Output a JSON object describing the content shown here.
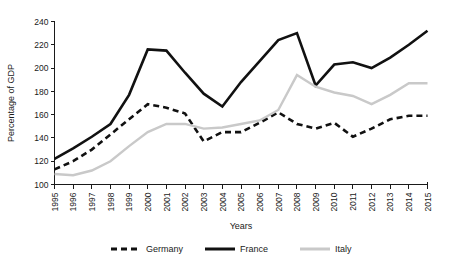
{
  "chart_data": {
    "type": "line",
    "title": "",
    "xlabel": "Years",
    "ylabel": "Percentage of GDP",
    "grid": false,
    "legend_position": "bottom",
    "ylim": [
      100,
      240
    ],
    "yticks": [
      100,
      120,
      140,
      160,
      180,
      200,
      220,
      240
    ],
    "categories": [
      "1995",
      "1996",
      "1997",
      "1998",
      "1999",
      "2000",
      "2001",
      "2002",
      "2003",
      "2004",
      "2005",
      "2006",
      "2007",
      "2008",
      "2009",
      "2010",
      "2011",
      "2012",
      "2013",
      "2014",
      "2015"
    ],
    "series": [
      {
        "name": "Germany",
        "style": "dashed",
        "color": "#111111",
        "values": [
          113,
          120,
          130,
          143,
          156,
          169,
          166,
          161,
          137,
          145,
          145,
          153,
          162,
          152,
          148,
          153,
          141,
          148,
          156,
          159,
          159
        ]
      },
      {
        "name": "France",
        "style": "solid",
        "color": "#111111",
        "values": [
          122,
          131,
          141,
          152,
          177,
          216,
          215,
          196,
          178,
          167,
          188,
          206,
          224,
          230,
          185,
          203,
          205,
          200,
          209,
          220,
          232
        ]
      },
      {
        "name": "Italy",
        "style": "solid",
        "color": "#c9c9c9",
        "values": [
          109,
          108,
          112,
          120,
          133,
          145,
          152,
          152,
          148,
          149,
          152,
          155,
          164,
          194,
          184,
          179,
          176,
          169,
          177,
          187,
          187
        ]
      }
    ]
  },
  "legend": {
    "items": [
      {
        "label": "Germany"
      },
      {
        "label": "France"
      },
      {
        "label": "Italy"
      }
    ]
  }
}
